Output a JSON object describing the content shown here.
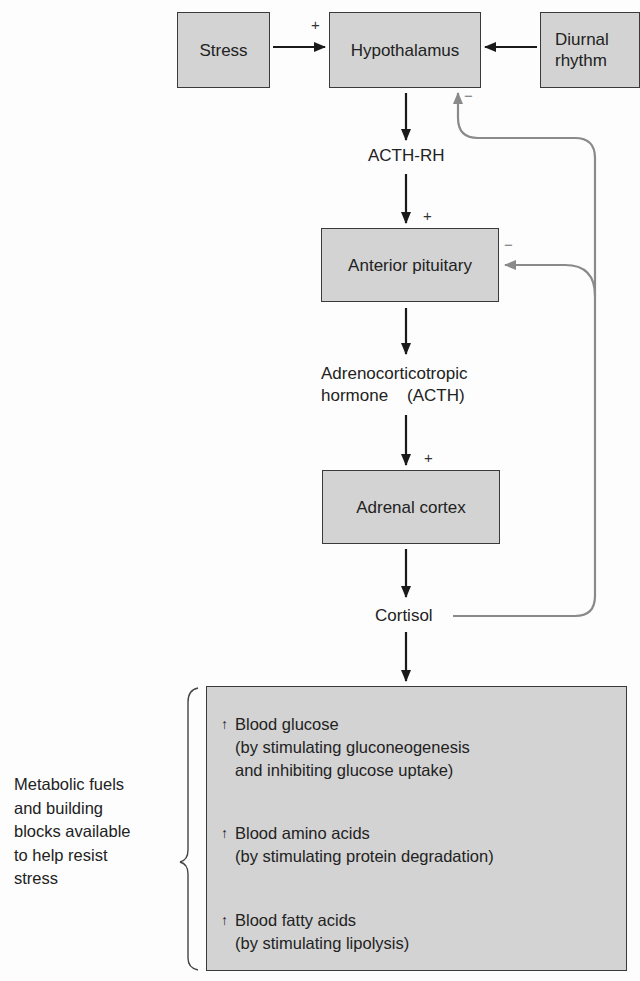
{
  "diagram": {
    "type": "flowchart",
    "nodes": {
      "stress": "Stress",
      "hypothalamus": "Hypothalamus",
      "diurnal": [
        "Diurnal",
        "rhythm"
      ],
      "acth_rh": "ACTH-RH",
      "anterior_pituitary": "Anterior pituitary",
      "acth": [
        "Adrenocorticotropic",
        "hormone    (ACTH)"
      ],
      "adrenal_cortex": "Adrenal cortex",
      "cortisol": "Cortisol"
    },
    "signs": {
      "stress_to_hypothalamus": "+",
      "feedback_hypothalamus": "−",
      "acth_rh_to_pituitary": "+",
      "feedback_pituitary": "−",
      "acth_to_adrenal": "+"
    },
    "effects": [
      {
        "arrow": "↑",
        "title": "Blood glucose",
        "detail": [
          "(by stimulating gluconeogenesis",
          "and inhibiting glucose uptake)"
        ]
      },
      {
        "arrow": "↑",
        "title": "Blood amino acids",
        "detail": [
          "(by stimulating protein degradation)"
        ]
      },
      {
        "arrow": "↑",
        "title": "Blood fatty acids",
        "detail": [
          "(by stimulating lipolysis)"
        ]
      }
    ],
    "side_note": [
      "Metabolic fuels",
      "and building",
      "blocks available",
      "to help resist",
      "stress"
    ],
    "colors": {
      "box_fill": "#d3d3d3",
      "box_border": "#3a3a3a",
      "arrow": "#1a1a1a",
      "feedback": "#8a8a8a"
    }
  }
}
